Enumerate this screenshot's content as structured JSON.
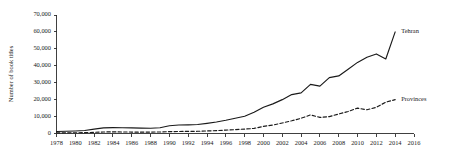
{
  "chart_data": {
    "type": "line",
    "title": "",
    "subtitle": "",
    "xlabel": "",
    "ylabel": "Number of book titles",
    "xlim": [
      1978,
      2016
    ],
    "ylim": [
      0,
      70000
    ],
    "grid": false,
    "legend_position": "right-inline",
    "y_ticks": [
      0,
      10000,
      20000,
      30000,
      40000,
      50000,
      60000,
      70000
    ],
    "y_tick_labels": [
      "0",
      "10,000",
      "20,000",
      "30,000",
      "40,000",
      "50,000",
      "60,000",
      "70,000"
    ],
    "x_ticks": [
      1978,
      1980,
      1982,
      1984,
      1986,
      1988,
      1990,
      1992,
      1994,
      1996,
      1998,
      2000,
      2002,
      2004,
      2006,
      2008,
      2010,
      2012,
      2014,
      2016
    ],
    "x_tick_labels": [
      "1978",
      "1980",
      "1982",
      "1984",
      "1986",
      "1988",
      "1990",
      "1992",
      "1994",
      "1996",
      "1998",
      "2000",
      "2002",
      "2004",
      "2006",
      "2008",
      "2010",
      "2012",
      "2014",
      "2016"
    ],
    "x": [
      1978,
      1979,
      1980,
      1981,
      1982,
      1983,
      1984,
      1985,
      1986,
      1987,
      1988,
      1989,
      1990,
      1991,
      1992,
      1993,
      1994,
      1995,
      1996,
      1997,
      1998,
      1999,
      2000,
      2001,
      2002,
      2003,
      2004,
      2005,
      2006,
      2007,
      2008,
      2009,
      2010,
      2011,
      2012,
      2013,
      2014
    ],
    "series": [
      {
        "name": "Tehran",
        "style": "solid",
        "color": "#1a1a1a",
        "values": [
          1200,
          1300,
          1500,
          1800,
          2600,
          3300,
          3500,
          3400,
          3300,
          3200,
          3100,
          3400,
          4600,
          5000,
          5100,
          5300,
          6000,
          6800,
          7800,
          9000,
          10200,
          12500,
          15500,
          17500,
          20000,
          23000,
          24000,
          29000,
          28000,
          33000,
          34000,
          38000,
          42000,
          45000,
          47000,
          44000,
          60000
        ]
      },
      {
        "name": "Provinces",
        "style": "dashed",
        "color": "#1a1a1a",
        "values": [
          400,
          420,
          450,
          500,
          700,
          900,
          950,
          900,
          850,
          800,
          850,
          900,
          1100,
          1200,
          1250,
          1300,
          1500,
          1700,
          2000,
          2300,
          2600,
          3000,
          4200,
          5000,
          6200,
          7500,
          9000,
          11000,
          9500,
          10000,
          11500,
          13000,
          15000,
          14000,
          15500,
          18500,
          20000
        ]
      }
    ],
    "annotations": []
  }
}
